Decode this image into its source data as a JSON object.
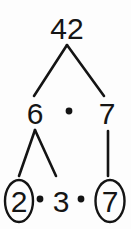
{
  "diagram": {
    "title": "42",
    "type": "factor-tree",
    "background_color": "#fdfdfd",
    "ink_color": "#141414",
    "levels": [
      {
        "level": 0,
        "nodes": [
          {
            "id": "root",
            "label": "42",
            "x": 67,
            "y": 39,
            "circled": false
          }
        ],
        "operators": []
      },
      {
        "level": 1,
        "nodes": [
          {
            "id": "six",
            "label": "6",
            "x": 35,
            "y": 124,
            "circled": false
          },
          {
            "id": "seven-mid",
            "label": "7",
            "x": 107,
            "y": 124,
            "circled": false
          }
        ],
        "operators": [
          {
            "id": "dot-mid",
            "label": "·",
            "x": 69,
            "y": 111
          }
        ]
      },
      {
        "level": 2,
        "nodes": [
          {
            "id": "two",
            "label": "2",
            "x": 19,
            "y": 211,
            "circled": true
          },
          {
            "id": "three",
            "label": "3",
            "x": 61,
            "y": 211,
            "circled": false
          },
          {
            "id": "seven-bottom",
            "label": "7",
            "x": 110,
            "y": 211,
            "circled": true
          }
        ],
        "operators": [
          {
            "id": "dot-left",
            "label": "·",
            "x": 40,
            "y": 199
          },
          {
            "id": "dot-right",
            "label": "·",
            "x": 81,
            "y": 199
          }
        ]
      }
    ],
    "edges": [
      {
        "id": "edge-42-6",
        "from": "root",
        "to": "six",
        "x1": 67,
        "y1": 45,
        "x2": 34,
        "y2": 96
      },
      {
        "id": "edge-42-7",
        "from": "root",
        "to": "seven-mid",
        "x1": 67,
        "y1": 45,
        "x2": 104,
        "y2": 96
      },
      {
        "id": "edge-6-2",
        "from": "six",
        "to": "two",
        "x1": 35,
        "y1": 130,
        "x2": 19,
        "y2": 176
      },
      {
        "id": "edge-6-3",
        "from": "six",
        "to": "three",
        "x1": 35,
        "y1": 130,
        "x2": 56,
        "y2": 176
      },
      {
        "id": "edge-7-7",
        "from": "seven-mid",
        "to": "seven-bottom",
        "x1": 108,
        "y1": 131,
        "x2": 108,
        "y2": 176
      }
    ],
    "circles": [
      {
        "id": "circle-two",
        "cx": 19,
        "cy": 201,
        "rx": 14,
        "ry": 21
      },
      {
        "id": "circle-seven",
        "cx": 110,
        "cy": 201,
        "rx": 14.5,
        "ry": 21
      }
    ],
    "factorization": {
      "product": "42",
      "prime_factors": [
        2,
        3,
        7
      ],
      "expression": "42 = 2 · 3 · 7",
      "intermediate": [
        6,
        7
      ]
    }
  }
}
